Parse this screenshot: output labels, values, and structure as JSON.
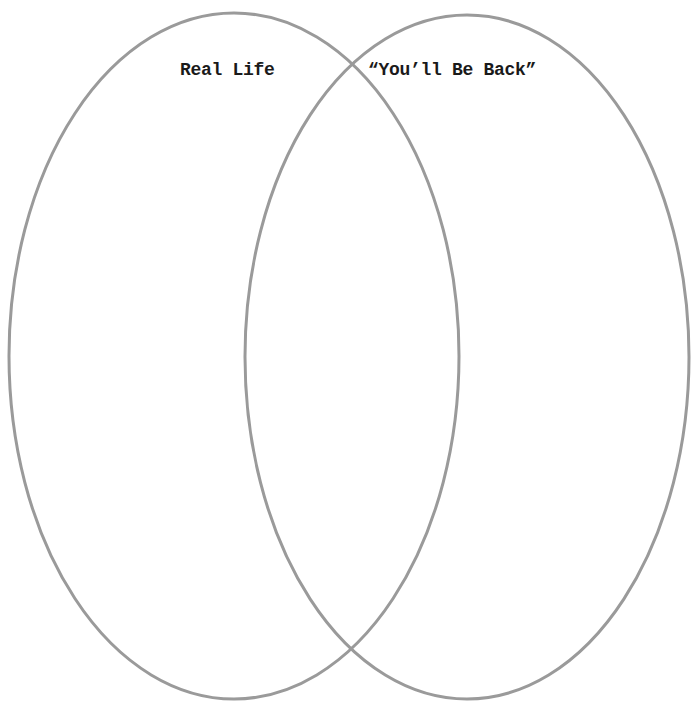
{
  "diagram": {
    "type": "venn",
    "sets": [
      {
        "label": "Real Life",
        "ellipse": {
          "cx": 234,
          "cy": 356,
          "rx": 225,
          "ry": 343
        }
      },
      {
        "label": "“You’ll Be Back”",
        "ellipse": {
          "cx": 467,
          "cy": 357,
          "rx": 222,
          "ry": 342
        }
      }
    ],
    "stroke_color": "#9a9a9a",
    "stroke_width": 3,
    "background_color": "#ffffff",
    "text_color": "#1a1a1a"
  }
}
